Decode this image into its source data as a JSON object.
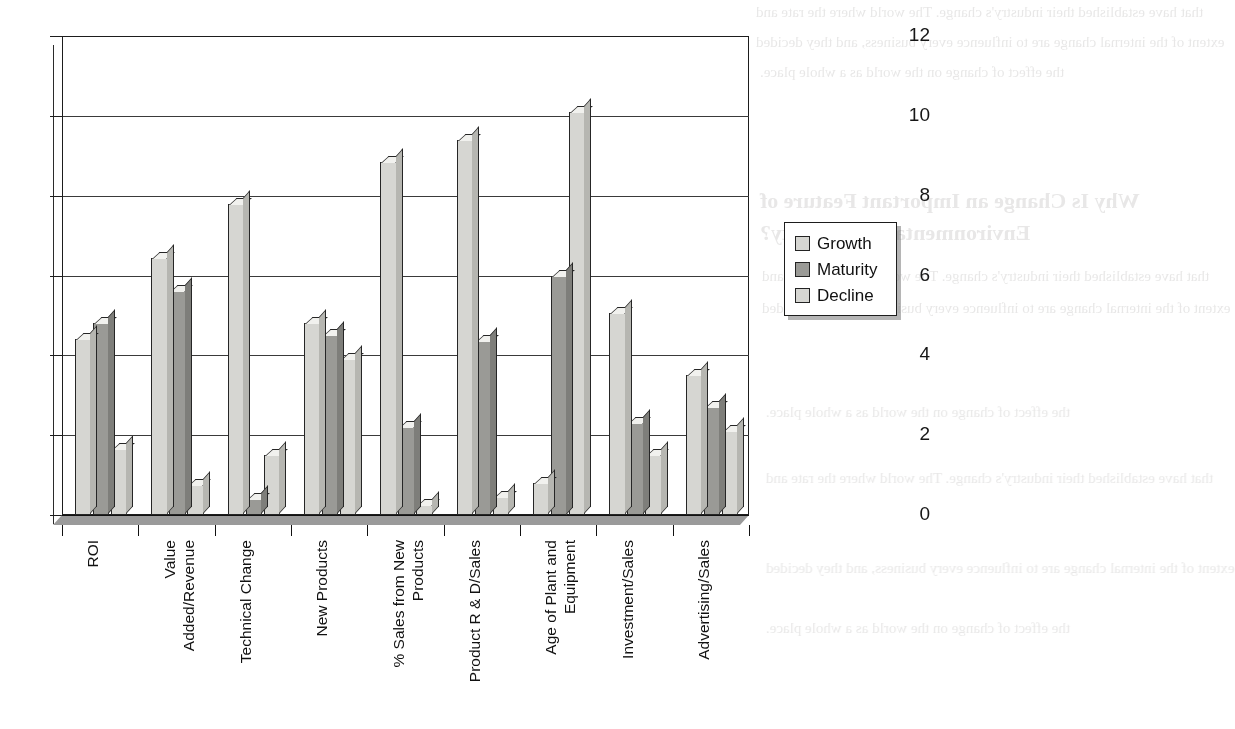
{
  "chart_data": {
    "type": "bar",
    "title": "",
    "subtitle": "",
    "xlabel": "",
    "ylabel": "",
    "ylim": [
      0,
      12
    ],
    "yticks": [
      0,
      2,
      4,
      6,
      8,
      10,
      12
    ],
    "grid": true,
    "legend_position": "right",
    "style": "3d-clustered-column",
    "categories": [
      "ROI",
      "Value\nAdded/Revenue",
      "Technical Change",
      "New Products",
      "% Sales from New\nProducts",
      "Product R & D/Sales",
      "Age of Plant and\nEquipment",
      "Investment/Sales",
      "Advertising/Sales"
    ],
    "series": [
      {
        "name": "Growth",
        "color": "#d6d6d2",
        "values": [
          4.4,
          6.45,
          7.8,
          4.8,
          8.85,
          9.4,
          0.8,
          5.05,
          3.5
        ]
      },
      {
        "name": "Maturity",
        "color": "#9a9a96",
        "values": [
          4.8,
          5.6,
          0.4,
          4.5,
          2.2,
          4.35,
          6.0,
          2.3,
          2.7
        ]
      },
      {
        "name": "Decline",
        "color": "#d6d6d2",
        "values": [
          1.65,
          0.75,
          1.5,
          3.9,
          0.25,
          0.45,
          10.1,
          1.5,
          2.1
        ]
      }
    ]
  },
  "legend": {
    "items": [
      {
        "label": "Growth",
        "color": "#d6d6d2"
      },
      {
        "label": "Maturity",
        "color": "#9a9a96"
      },
      {
        "label": "Decline",
        "color": "#d6d6d2"
      }
    ]
  },
  "axis": {
    "y_tick_labels": [
      "12",
      "10",
      "8",
      "6",
      "4",
      "2",
      "0"
    ]
  },
  "background_text": {
    "note": "faint show-through text from the reverse side of the printed page",
    "heading": "Why Is Change an Important Feature of",
    "heading2": "Environmental Uncertainty?",
    "lines": [
      "that have established their industry's change. The world where the rate and",
      "extent of the internal change are to influence every business, and they decided",
      "the effect of change on the world as a whole place."
    ]
  }
}
